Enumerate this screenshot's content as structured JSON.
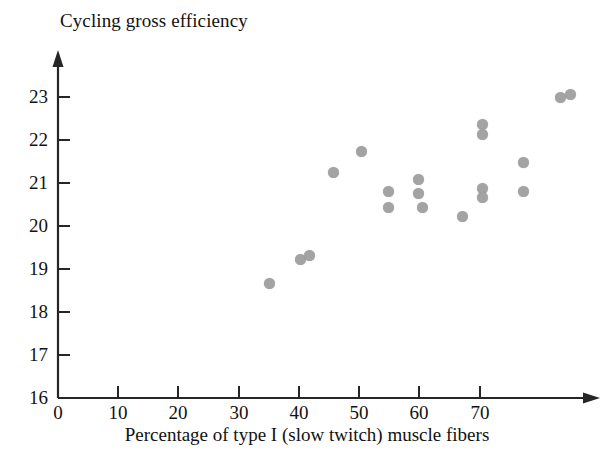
{
  "chart_data": {
    "type": "scatter",
    "title": "Cycling gross efficiency",
    "xlabel": "Percentage of type I (slow twitch) muscle fibers",
    "ylabel": "Cycling gross efficiency",
    "xlim": [
      0,
      78
    ],
    "ylim": [
      16,
      23.6
    ],
    "xticks": [
      0,
      10,
      20,
      30,
      40,
      50,
      60,
      70
    ],
    "yticks": [
      16,
      17,
      18,
      19,
      20,
      21,
      22,
      23
    ],
    "xtick_labels": [
      "0",
      "10",
      "20",
      "30",
      "40",
      "50",
      "60",
      "70"
    ],
    "ytick_labels": [
      "16",
      "17",
      "18",
      "19",
      "20",
      "21",
      "22",
      "23"
    ],
    "grid": false,
    "legend": false,
    "marker": {
      "shape": "circle",
      "color": "#a3a3a3",
      "size_px": 11
    },
    "axis_color": "#262626",
    "points": [
      {
        "x": 35.0,
        "y": 18.4
      },
      {
        "x": 40.2,
        "y": 19.0
      },
      {
        "x": 41.7,
        "y": 19.1
      },
      {
        "x": 45.7,
        "y": 21.05
      },
      {
        "x": 50.3,
        "y": 21.55
      },
      {
        "x": 54.8,
        "y": 20.6
      },
      {
        "x": 54.8,
        "y": 20.25
      },
      {
        "x": 59.8,
        "y": 20.95
      },
      {
        "x": 59.8,
        "y": 20.6
      },
      {
        "x": 60.4,
        "y": 20.25
      },
      {
        "x": 67.1,
        "y": 20.0
      },
      {
        "x": 70.4,
        "y": 22.3
      },
      {
        "x": 70.4,
        "y": 22.05
      },
      {
        "x": 70.4,
        "y": 20.8
      },
      {
        "x": 70.4,
        "y": 20.6
      },
      {
        "x": 77.2,
        "y": 21.35
      },
      {
        "x": 77.2,
        "y": 20.6
      },
      {
        "x": 83.4,
        "y": 22.8
      },
      {
        "x": 85.0,
        "y": 22.9
      }
    ],
    "points_display": [
      {
        "px": 269,
        "py": 283
      },
      {
        "px": 300,
        "py": 259
      },
      {
        "px": 309,
        "py": 255
      },
      {
        "px": 333,
        "py": 172
      },
      {
        "px": 361,
        "py": 151
      },
      {
        "px": 388,
        "py": 191
      },
      {
        "px": 388,
        "py": 207
      },
      {
        "px": 418,
        "py": 179
      },
      {
        "px": 418,
        "py": 193
      },
      {
        "px": 422,
        "py": 207
      },
      {
        "px": 462,
        "py": 216
      },
      {
        "px": 482,
        "py": 124
      },
      {
        "px": 482,
        "py": 134
      },
      {
        "px": 482,
        "py": 188
      },
      {
        "px": 482,
        "py": 197
      },
      {
        "px": 523,
        "py": 162
      },
      {
        "px": 523,
        "py": 191
      },
      {
        "px": 560,
        "py": 97
      },
      {
        "px": 570,
        "py": 94
      }
    ]
  }
}
